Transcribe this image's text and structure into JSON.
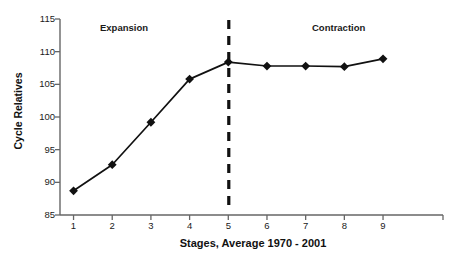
{
  "chart_data": {
    "type": "line",
    "title": "",
    "xlabel": "Stages, Average 1970 - 2001",
    "ylabel": "Cycle Relatives",
    "x": [
      1,
      2,
      3,
      4,
      5,
      6,
      7,
      8,
      9
    ],
    "categories": [
      "1",
      "2",
      "3",
      "4",
      "5",
      "6",
      "7",
      "8",
      "9"
    ],
    "values": [
      88.7,
      92.7,
      99.2,
      105.8,
      108.4,
      107.8,
      107.8,
      107.7,
      108.9
    ],
    "series": [
      {
        "name": "Cycle Relatives",
        "values": [
          88.7,
          92.7,
          99.2,
          105.8,
          108.4,
          107.8,
          107.8,
          107.7,
          108.9
        ]
      }
    ],
    "xlim": [
      0.5,
      9.5
    ],
    "ylim": [
      85,
      115
    ],
    "yticks": [
      85,
      90,
      95,
      100,
      105,
      110,
      115
    ],
    "ytick_labels": [
      "85",
      "90",
      "95",
      "100",
      "105",
      "110",
      "115"
    ],
    "xticks": [
      1,
      2,
      3,
      4,
      5,
      6,
      7,
      8,
      9
    ],
    "xtick_labels": [
      "1",
      "2",
      "3",
      "4",
      "5",
      "6",
      "7",
      "8",
      "9"
    ],
    "grid": false,
    "legend": false,
    "legend_position": "none",
    "marker": "diamond",
    "line_color": "#111111",
    "marker_color": "#111111",
    "annotations": [
      {
        "text": "Expansion",
        "x": 1.9,
        "y": 113.5
      },
      {
        "text": "Contraction",
        "x": 6.8,
        "y": 113.5
      }
    ],
    "reference_lines": [
      {
        "orientation": "vertical",
        "x": 5,
        "style": "dashed",
        "color": "#111111"
      }
    ]
  },
  "axis": {
    "y_title": "Cycle Relatives",
    "x_title": "Stages, Average 1970 - 2001",
    "y_labels": [
      "115",
      "110",
      "105",
      "100",
      "95",
      "90",
      "85"
    ],
    "x_labels": [
      "1",
      "2",
      "3",
      "4",
      "5",
      "6",
      "7",
      "8",
      "9"
    ]
  },
  "annotations": {
    "expansion": "Expansion",
    "contraction": "Contraction"
  },
  "colors": {
    "background": "#ffffff",
    "axis": "#555555",
    "series": "#111111",
    "text": "#1a1a1a",
    "divider": "#111111"
  }
}
